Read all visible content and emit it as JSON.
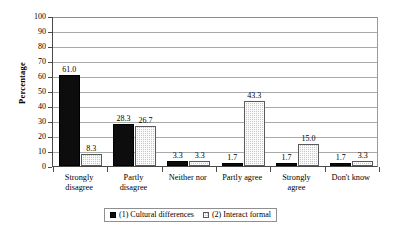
{
  "chart_data": {
    "type": "bar",
    "title": "",
    "xlabel": "",
    "ylabel": "Percentage",
    "ylim": [
      0,
      100
    ],
    "ytick_step": 10,
    "yticks": [
      100,
      90,
      80,
      70,
      60,
      50,
      40,
      30,
      20,
      10,
      0
    ],
    "grid": true,
    "legend_position": "bottom",
    "categories": [
      "Strongly disagree",
      "Partly disagree",
      "Neither nor",
      "Partly agree",
      "Strongly agree",
      "Don't know"
    ],
    "category_lines": [
      [
        "Strongly",
        "disagree"
      ],
      [
        "Partly",
        "disagree"
      ],
      [
        "Neither nor",
        ""
      ],
      [
        "Partly agree",
        ""
      ],
      [
        "Strongly",
        "agree"
      ],
      [
        "Don't know",
        ""
      ]
    ],
    "series": [
      {
        "name": "(1) Cultural differences",
        "color": "#0d0d0d",
        "values": [
          61.0,
          28.3,
          3.3,
          1.7,
          1.7,
          1.7
        ],
        "labels": [
          "61.0",
          "28.3",
          "3.3",
          "1.7",
          "1.7",
          "1.7"
        ]
      },
      {
        "name": "(2)  Interact formal",
        "color": "#c9c9c9",
        "values": [
          8.3,
          26.7,
          3.3,
          43.3,
          15.0,
          3.3
        ],
        "labels": [
          "8.3",
          "26.7",
          "3.3",
          "43.3",
          "15.0",
          "3.3"
        ]
      }
    ]
  }
}
